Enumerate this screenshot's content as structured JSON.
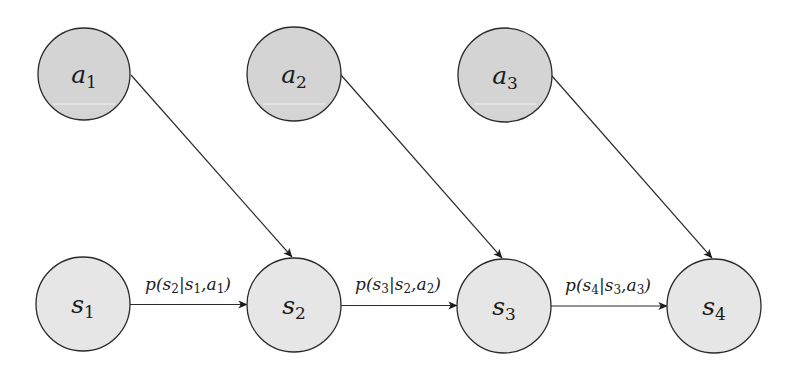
{
  "diagram": {
    "type": "graphical-model",
    "colors": {
      "action_fill": "#d4d4d4",
      "state_fill": "#e6e6e6",
      "stroke": "#2a2a2a",
      "background": "#ffffff"
    },
    "action_nodes": [
      {
        "id": "a1",
        "var": "a",
        "sub": "1",
        "cx": 84,
        "cy": 74,
        "r": 46
      },
      {
        "id": "a2",
        "var": "a",
        "sub": "2",
        "cx": 294,
        "cy": 74,
        "r": 47
      },
      {
        "id": "a3",
        "var": "a",
        "sub": "3",
        "cx": 505,
        "cy": 75,
        "r": 47
      }
    ],
    "state_nodes": [
      {
        "id": "s1",
        "var": "s",
        "sub": "1",
        "cx": 83,
        "cy": 304,
        "r": 47
      },
      {
        "id": "s2",
        "var": "s",
        "sub": "2",
        "cx": 294,
        "cy": 305,
        "r": 47
      },
      {
        "id": "s3",
        "var": "s",
        "sub": "3",
        "cx": 504,
        "cy": 306,
        "r": 47
      },
      {
        "id": "s4",
        "var": "s",
        "sub": "4",
        "cx": 714,
        "cy": 306,
        "r": 47
      }
    ],
    "transition_edges": [
      {
        "from": "s1",
        "to": "s2",
        "label": {
          "p": "p(",
          "s_next": "s",
          "s_next_sub": "2",
          "bar": "|",
          "s_prev": "s",
          "s_prev_sub": "1",
          "comma": ",",
          "a": "a",
          "a_sub": "1",
          "close": ")"
        }
      },
      {
        "from": "s2",
        "to": "s3",
        "label": {
          "p": "p(",
          "s_next": "s",
          "s_next_sub": "3",
          "bar": "|",
          "s_prev": "s",
          "s_prev_sub": "2",
          "comma": ",",
          "a": "a",
          "a_sub": "2",
          "close": ")"
        }
      },
      {
        "from": "s3",
        "to": "s4",
        "label": {
          "p": "p(",
          "s_next": "s",
          "s_next_sub": "4",
          "bar": "|",
          "s_prev": "s",
          "s_prev_sub": "3",
          "comma": ",",
          "a": "a",
          "a_sub": "3",
          "close": ")"
        }
      }
    ],
    "action_edges": [
      {
        "from": "a1",
        "to": "s2"
      },
      {
        "from": "a2",
        "to": "s3"
      },
      {
        "from": "a3",
        "to": "s4"
      }
    ]
  }
}
